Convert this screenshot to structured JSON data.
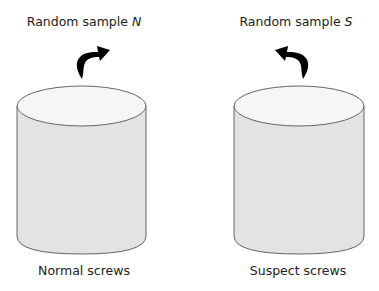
{
  "diagram": {
    "left": {
      "sample_label": "Random sample ",
      "sample_var": "N",
      "container_label": "Normal screws",
      "arrow_direction": "up-right"
    },
    "right": {
      "sample_label": "Random sample ",
      "sample_var": "S",
      "container_label": "Suspect screws",
      "arrow_direction": "up-left"
    },
    "colors": {
      "cylinder_body": "#e3e3e3",
      "cylinder_top": "#f6f6f6",
      "outline": "#555555",
      "arrow": "#000000"
    }
  }
}
